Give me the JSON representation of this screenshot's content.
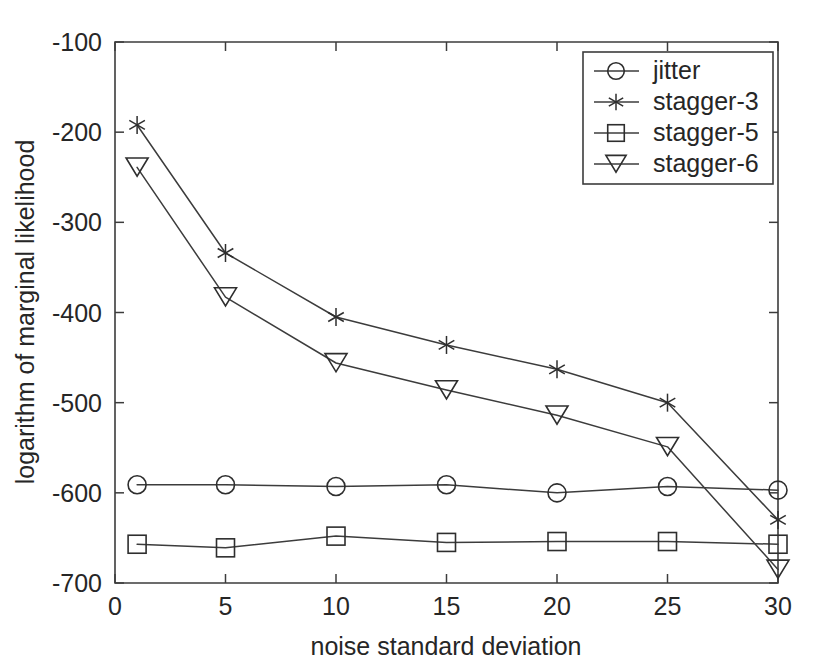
{
  "chart_data": {
    "type": "line",
    "title": "",
    "xlabel": "noise standard deviation",
    "ylabel": "logarithm of marginal likelihood",
    "x": [
      1,
      5,
      10,
      15,
      20,
      25,
      30
    ],
    "xlim": [
      0,
      30
    ],
    "ylim": [
      -700,
      -100
    ],
    "xticks": [
      0,
      5,
      10,
      15,
      20,
      25,
      30
    ],
    "yticks": [
      -700,
      -600,
      -500,
      -400,
      -300,
      -200,
      -100
    ],
    "xtick_labels": [
      "0",
      "5",
      "10",
      "15",
      "20",
      "25",
      "30"
    ],
    "ytick_labels": [
      "-700",
      "-600",
      "-500",
      "-400",
      "-300",
      "-200",
      "-100"
    ],
    "grid": false,
    "legend_position": "upper right",
    "series": [
      {
        "name": "jitter",
        "marker": "circle",
        "values": [
          -591,
          -591,
          -593,
          -591,
          -600,
          -593,
          -597
        ]
      },
      {
        "name": "stagger-3",
        "marker": "star",
        "values": [
          -192,
          -334,
          -405,
          -436,
          -463,
          -500,
          -630
        ]
      },
      {
        "name": "stagger-5",
        "marker": "square",
        "values": [
          -657,
          -661,
          -648,
          -655,
          -654,
          -654,
          -657
        ]
      },
      {
        "name": "stagger-6",
        "marker": "triangle-down",
        "values": [
          -239,
          -383,
          -456,
          -486,
          -514,
          -549,
          -685
        ]
      }
    ]
  },
  "legend": {
    "entries": [
      {
        "label": "jitter",
        "marker": "circle-icon"
      },
      {
        "label": "stagger-3",
        "marker": "star-icon"
      },
      {
        "label": "stagger-5",
        "marker": "square-icon"
      },
      {
        "label": "stagger-6",
        "marker": "triangle-down-icon"
      }
    ]
  },
  "colors": {
    "axis": "#3c3c3c",
    "series": "#2e2e2e",
    "background": "#ffffff",
    "text": "#262626"
  }
}
